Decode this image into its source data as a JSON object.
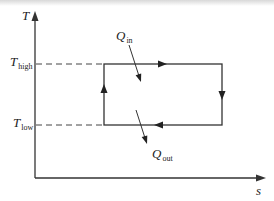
{
  "diagram": {
    "type": "T-s diagram (Carnot cycle)",
    "axes": {
      "y_label": "T",
      "x_label": "s"
    },
    "levels": {
      "high": {
        "symbol": "T",
        "subscript": "high"
      },
      "low": {
        "symbol": "T",
        "subscript": "low"
      }
    },
    "heat": {
      "in": {
        "symbol": "Q",
        "subscript": "in"
      },
      "out": {
        "symbol": "Q",
        "subscript": "out"
      }
    },
    "cycle_direction": "clockwise",
    "colors": {
      "line": "#333333",
      "dash": "#444444",
      "text": "#222222"
    }
  }
}
